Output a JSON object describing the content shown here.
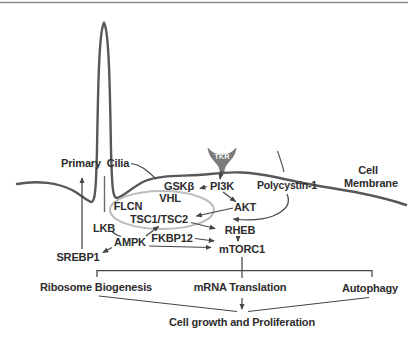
{
  "diagram_title": "Primary cilium / polycystin-1 signaling to mTORC1",
  "nodes": {
    "primary": "Primary",
    "cilia": "Cilia",
    "cell": "Cell",
    "membrane": "Membrane",
    "tkr": "TKR",
    "gskb": "GSKβ",
    "pi3k": "PI3K",
    "polycystin1": "Polycystin-1",
    "flcn": "FLCN",
    "vhl": "VHL",
    "tsc": "TSC1/TSC2",
    "akt": "AKT",
    "lkb": "LKB",
    "ampk": "AMPK",
    "fkbp12": "FKBP12",
    "rheb": "RHEB",
    "mtorc1": "mTORC1",
    "srebp1": "SREBP1",
    "ribosome_biogenesis": "Ribosome Biogenesis",
    "mrna_translation": "mRNA Translation",
    "autophagy": "Autophagy",
    "cell_growth": "Cell growth and Proliferation"
  },
  "colors": {
    "background": "#ffffff",
    "text": "#2d2d2d",
    "membrane_line": "#58585a",
    "arrow_line": "#454545",
    "compartment_ellipse": "#bcbcbc",
    "receptor_fill": "#7b7b7b",
    "receptor_text": "#ffffff",
    "top_border": "#8a8a8a"
  }
}
